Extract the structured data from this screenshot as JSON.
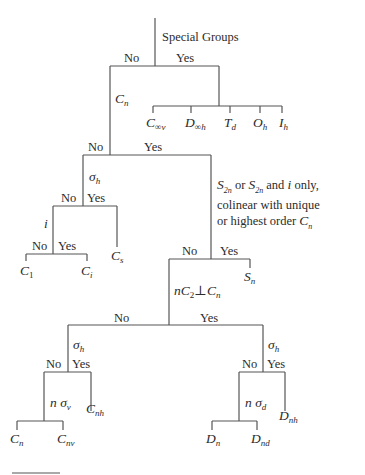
{
  "diagram": {
    "root": {
      "question": "Special Groups",
      "no": "No",
      "yes": "Yes",
      "special_groups": [
        {
          "base": "C",
          "sub": "∞v"
        },
        {
          "base": "D",
          "sub": "∞h"
        },
        {
          "base": "T",
          "sub": "d"
        },
        {
          "base": "O",
          "sub": "h"
        },
        {
          "base": "I",
          "sub": "h"
        }
      ]
    },
    "cn_node": {
      "base": "C",
      "sub": "n",
      "no": "No",
      "yes": "Yes"
    },
    "sigma_h_low": {
      "base": "σ",
      "sub": "h",
      "no": "No",
      "yes": "Yes",
      "yes_result": {
        "base": "C",
        "sub": "s"
      }
    },
    "i_node": {
      "label": "i",
      "no": "No",
      "yes": "Yes",
      "no_result": {
        "base": "C",
        "sub": "1"
      },
      "yes_result": {
        "base": "C",
        "sub": "i"
      }
    },
    "s2n_node": {
      "line1_a": "S",
      "line1_a_sub": "2n",
      "line1_b": " or ",
      "line1_c": "S",
      "line1_c_sub": "2n",
      "line1_d": " and ",
      "line1_e": "i",
      "line1_f": " only,",
      "line2": "colinear with unique",
      "line3_a": "or highest order ",
      "line3_b": "C",
      "line3_b_sub": "n",
      "no": "No",
      "yes": "Yes",
      "yes_result": {
        "base": "S",
        "sub": "n"
      }
    },
    "nc2_node": {
      "n": "n",
      "c": "C",
      "c_sub": "2",
      "perp": "⊥",
      "cn": "C",
      "cn_sub": "n",
      "no": "No",
      "yes": "Yes"
    },
    "left_sigma_h": {
      "base": "σ",
      "sub": "h",
      "no": "No",
      "yes": "Yes",
      "yes_result": {
        "base": "C",
        "sub": "nh"
      }
    },
    "n_sigma_v": {
      "n": "n ",
      "base": "σ",
      "sub": "v",
      "no_result": {
        "base": "C",
        "sub": "n"
      },
      "yes_result": {
        "base": "C",
        "sub": "nv"
      }
    },
    "right_sigma_h": {
      "base": "σ",
      "sub": "h",
      "no": "No",
      "yes": "Yes",
      "yes_result": {
        "base": "D",
        "sub": "nh"
      }
    },
    "n_sigma_d": {
      "n": "n ",
      "base": "σ",
      "sub": "d",
      "no_result": {
        "base": "D",
        "sub": "n"
      },
      "yes_result": {
        "base": "D",
        "sub": "nd"
      }
    }
  },
  "colors": {
    "line": "#555555",
    "text": "#2b2b2b",
    "accent_line": "#8a3a8a"
  }
}
